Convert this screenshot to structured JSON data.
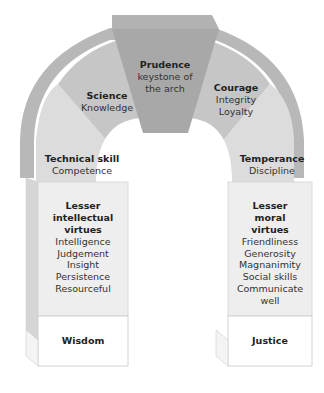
{
  "diagram": {
    "type": "arch",
    "keystone": {
      "title": "Prudence",
      "lines": [
        "keystone of",
        "the arch"
      ]
    },
    "left_arch": [
      {
        "title": "Science",
        "lines": [
          "Knowledge"
        ]
      },
      {
        "title": "Technical skill",
        "lines": [
          "Competence"
        ]
      }
    ],
    "right_arch": [
      {
        "title": "Courage",
        "lines": [
          "Integrity",
          "Loyalty"
        ]
      },
      {
        "title": "Temperance",
        "lines": [
          "Discipline"
        ]
      }
    ],
    "left_pillar": {
      "heading": [
        "Lesser",
        "intellectual",
        "virtues"
      ],
      "items": [
        "Intelligence",
        "Judgement",
        "Insight",
        "Persistence",
        "Resourceful"
      ],
      "base": "Wisdom"
    },
    "right_pillar": {
      "heading": [
        "Lesser",
        "moral",
        "virtues"
      ],
      "items": [
        "Friendliness",
        "Generosity",
        "Magnanimity",
        "Social skills",
        "Communicate",
        "well"
      ],
      "base": "Justice"
    },
    "colors": {
      "keystone": "#a9a9a9",
      "upper_segment": "#c4c4c4",
      "lower_segment": "#dadada",
      "pillar": "#ececec",
      "base": "#ffffff",
      "outer_band": "#b5b5b5",
      "side_face": "#d3d3d3"
    }
  }
}
